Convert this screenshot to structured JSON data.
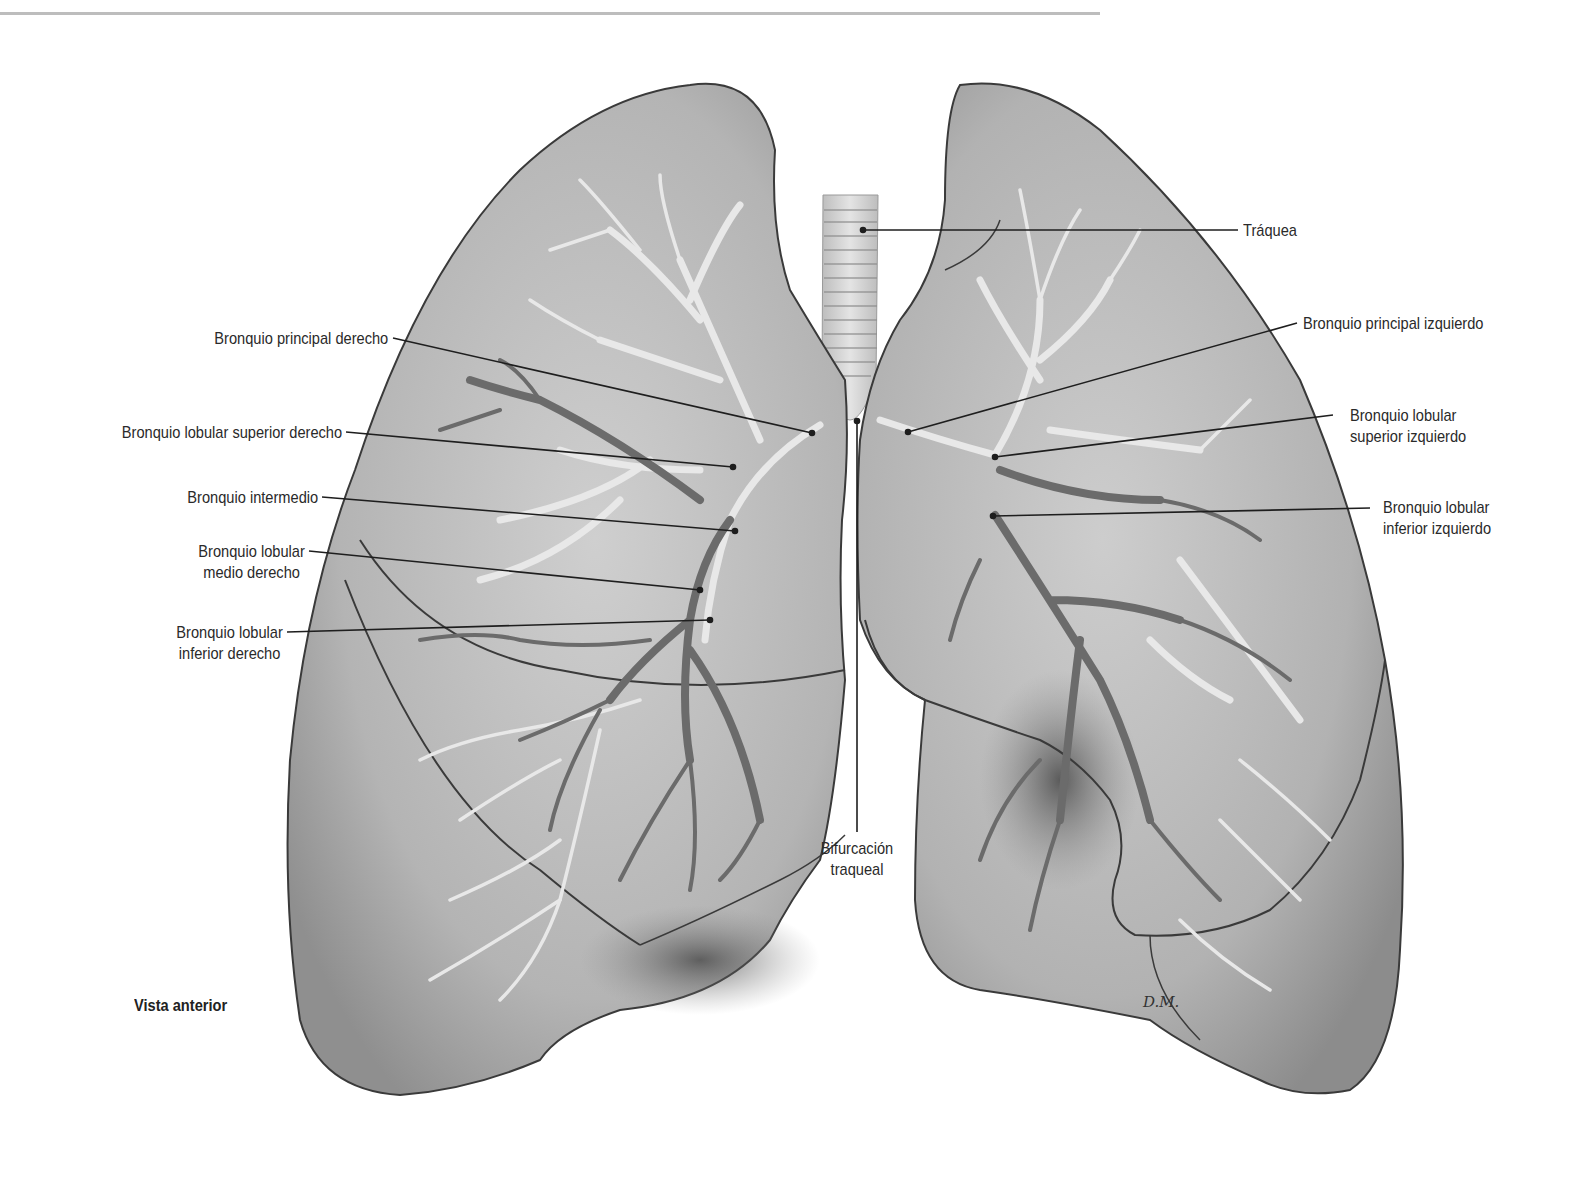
{
  "figure": {
    "view_title": "Vista anterior",
    "signature": "D.M.",
    "colors": {
      "lung_fill": "#b9b9b9",
      "lung_outline": "#3a3a3a",
      "airway_light": "#e6e6e6",
      "airway_dark": "#6e6e6e",
      "label_text": "#2a2a2a",
      "leader_line": "#1e1e1e"
    }
  },
  "labels": {
    "left_side": [
      {
        "id": "bronquio-principal-derecho",
        "lines": [
          "Bronquio principal derecho"
        ]
      },
      {
        "id": "bronquio-lobular-superior-derecho",
        "lines": [
          "Bronquio lobular superior derecho"
        ]
      },
      {
        "id": "bronquio-intermedio",
        "lines": [
          "Bronquio intermedio"
        ]
      },
      {
        "id": "bronquio-lobular-medio-derecho",
        "lines": [
          "Bronquio lobular",
          "medio derecho"
        ]
      },
      {
        "id": "bronquio-lobular-inferior-derecho",
        "lines": [
          "Bronquio lobular",
          "inferior derecho"
        ]
      }
    ],
    "right_side": [
      {
        "id": "traquea",
        "lines": [
          "Tráquea"
        ]
      },
      {
        "id": "bronquio-principal-izquierdo",
        "lines": [
          "Bronquio principal izquierdo"
        ]
      },
      {
        "id": "bronquio-lobular-superior-izquierdo",
        "lines": [
          "Bronquio lobular",
          "superior izquierdo"
        ]
      },
      {
        "id": "bronquio-lobular-inferior-izquierdo",
        "lines": [
          "Bronquio lobular",
          "inferior izquierdo"
        ]
      }
    ],
    "bottom": [
      {
        "id": "bifurcacion-traqueal",
        "lines": [
          "Bifurcación",
          "traqueal"
        ]
      }
    ]
  }
}
